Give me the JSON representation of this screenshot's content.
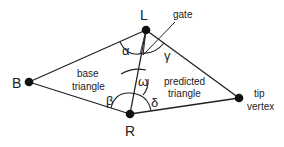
{
  "vertices": {
    "L": {
      "label": "L",
      "x": 146,
      "y": 30
    },
    "R": {
      "label": "R",
      "x": 130,
      "y": 114
    },
    "B": {
      "label": "B",
      "x": 29,
      "y": 82
    },
    "tip": {
      "label_line1": "tip",
      "label_line2": "vertex",
      "x": 239,
      "y": 98
    }
  },
  "labels": {
    "gate": "gate",
    "base_line1": "base",
    "base_line2": "triangle",
    "pred_line1": "predicted",
    "pred_line2": "triangle"
  },
  "angles": {
    "alpha": "α",
    "beta": "β",
    "gamma": "γ",
    "delta": "δ",
    "omega": "ω"
  },
  "colors": {
    "stroke": "#222222",
    "vertex": "#111111"
  }
}
